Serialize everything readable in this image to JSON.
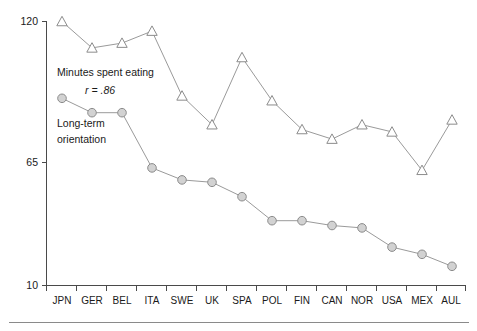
{
  "chart_data": {
    "type": "line",
    "title": "",
    "subtitle": "",
    "xlabel": "",
    "ylabel": "",
    "ylim": [
      10,
      120
    ],
    "yticks": [
      10,
      65,
      120
    ],
    "ytick_labels": [
      "10",
      "65",
      "120"
    ],
    "grid": false,
    "legend_position": "inline-annotations",
    "categories": [
      "JPN",
      "GER",
      "BEL",
      "ITA",
      "SWE",
      "UK",
      "SPA",
      "POL",
      "FIN",
      "CAN",
      "NOR",
      "USA",
      "MEX",
      "AUL"
    ],
    "series": [
      {
        "name": "Minutes spent eating",
        "marker": "triangle-open",
        "values": [
          120,
          109,
          111,
          116,
          89,
          77,
          105,
          87,
          75,
          71,
          77,
          74,
          58,
          79
        ]
      },
      {
        "name": "Long-term orientation",
        "marker": "circle-filled",
        "values": [
          88,
          82,
          82,
          59,
          54,
          53,
          47,
          37,
          37,
          35,
          34,
          26,
          23,
          18
        ]
      }
    ],
    "annotations": [
      {
        "id": "eating-label",
        "text": "Minutes spent eating",
        "x": 1.05,
        "y": 98
      },
      {
        "id": "eating-correlation",
        "text": "r = .86",
        "x": 1.55,
        "y": 90
      },
      {
        "id": "orientation-label-line1",
        "text": "Long-term",
        "x": 0.75,
        "y": 72
      },
      {
        "id": "orientation-label-line2",
        "text": "orientation",
        "x": 0.75,
        "y": 66
      }
    ],
    "colors": {
      "line": "#9a9a9a",
      "triangle_fill": "#ffffff",
      "triangle_stroke": "#8c8c8c",
      "circle_fill": "#d2d2d2",
      "circle_stroke": "#8c8c8c",
      "axis": "#4a4a4a",
      "text": "#1a1a1a",
      "background": "#ffffff"
    }
  },
  "axis": {
    "y_tick_top": "120",
    "y_tick_mid": "65",
    "y_tick_bottom": "10"
  },
  "annotations": {
    "eating_label": "Minutes spent eating",
    "eating_correlation": "r = .86",
    "orientation_line1": "Long-term",
    "orientation_line2": "orientation"
  },
  "xlabels": {
    "c0": "JPN",
    "c1": "GER",
    "c2": "BEL",
    "c3": "ITA",
    "c4": "SWE",
    "c5": "UK",
    "c6": "SPA",
    "c7": "POL",
    "c8": "FIN",
    "c9": "CAN",
    "c10": "NOR",
    "c11": "USA",
    "c12": "MEX",
    "c13": "AUL"
  }
}
